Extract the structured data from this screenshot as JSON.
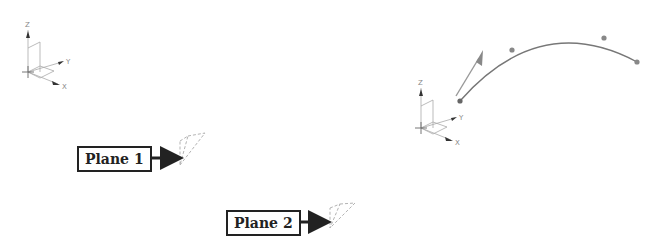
{
  "labels": {
    "plane1": "Plane 1",
    "plane2": "Plane 2"
  },
  "axes": {
    "x": "X",
    "y": "Y",
    "z": "Z"
  },
  "colors": {
    "line": "#999999",
    "curve": "#777777",
    "arrow": "#222222",
    "box_border": "#222222"
  }
}
